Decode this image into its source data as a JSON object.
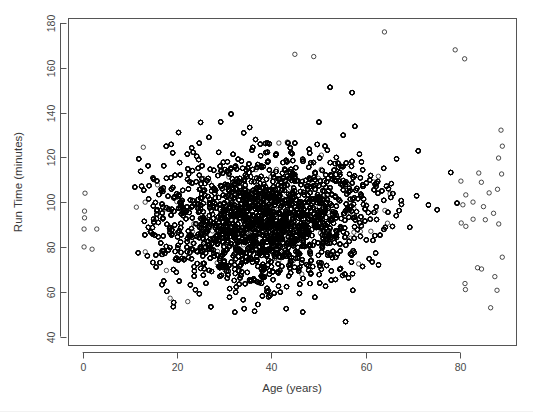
{
  "figure": {
    "width": 533,
    "height": 416,
    "background": "#ffffff",
    "point_color": "#000000",
    "axis_color": "#555555",
    "text_color": "#3a3a3a"
  },
  "chart_data": {
    "type": "scatter",
    "title": "",
    "xlabel": "Age (years)",
    "ylabel": "Run Time (minutes)",
    "xlim": [
      -3,
      92
    ],
    "ylim": [
      36,
      182
    ],
    "xticks": [
      0,
      20,
      40,
      60,
      80
    ],
    "yticks": [
      40,
      60,
      80,
      100,
      120,
      140,
      160,
      180
    ],
    "xtick_labels": [
      "0",
      "20",
      "40",
      "60",
      "80"
    ],
    "ytick_labels": [
      "40",
      "60",
      "80",
      "100",
      "120",
      "140",
      "160",
      "180"
    ],
    "grid": false,
    "legend": null,
    "marker": "open-circle",
    "marker_radius_px": 2.2,
    "n_points_approx": 12000,
    "summary_stats": {
      "age_min_observed": 0,
      "age_max_observed": 89,
      "runtime_min_observed": 43,
      "runtime_max_observed": 176,
      "core_age_range": [
        20,
        70
      ],
      "core_runtime_range": [
        45,
        125
      ],
      "runtime_median_approx": 95,
      "age_median_approx": 38
    },
    "notable_points": [
      {
        "age": 0.5,
        "runtime": 104
      },
      {
        "age": 0.4,
        "runtime": 96
      },
      {
        "age": 0.4,
        "runtime": 93
      },
      {
        "age": 0.3,
        "runtime": 88
      },
      {
        "age": 3.0,
        "runtime": 88
      },
      {
        "age": 0.3,
        "runtime": 80
      },
      {
        "age": 2.0,
        "runtime": 79
      },
      {
        "age": 64,
        "runtime": 176
      },
      {
        "age": 79,
        "runtime": 168
      },
      {
        "age": 45,
        "runtime": 166
      },
      {
        "age": 49,
        "runtime": 165
      },
      {
        "age": 81,
        "runtime": 164
      },
      {
        "age": 89,
        "runtime": 125
      },
      {
        "age": 84,
        "runtime": 113
      },
      {
        "age": 85,
        "runtime": 98
      }
    ]
  }
}
